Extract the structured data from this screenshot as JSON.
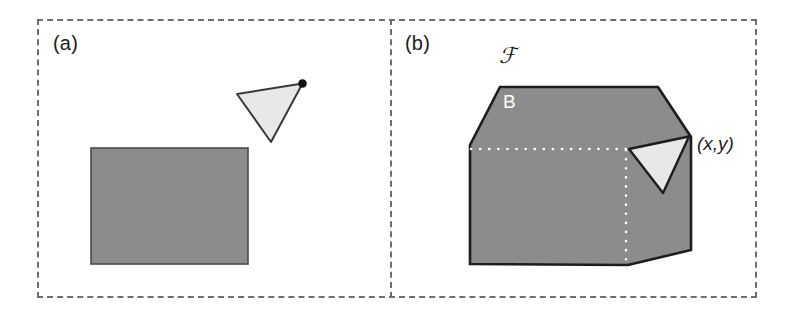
{
  "figure": {
    "type": "diagram",
    "background_color": "#ffffff",
    "frame": {
      "style": "dashed",
      "color": "#6e6e6e",
      "stroke_width": 2.2
    },
    "colors": {
      "grey_fill": "#8c8c8c",
      "light_fill": "#e8e8e8",
      "outline": "#1d1d1d",
      "dotted_white": "#ffffff",
      "label_dark": "#1d1d1d",
      "label_light": "#ffffff"
    }
  },
  "panels": [
    {
      "id": "a",
      "label": "(a)",
      "shapes": [
        {
          "name": "grey-rectangle",
          "kind": "rect",
          "x": 91,
          "y": 148,
          "width": 157,
          "height": 116,
          "fill": "#8c8c8c",
          "stroke": "#4a4a4a"
        },
        {
          "name": "light-triangle",
          "kind": "polygon",
          "points": "302.5,83.5 237,94 271,142",
          "fill": "#e8e8e8",
          "stroke": "#3a3a3a"
        },
        {
          "name": "vertex-dot",
          "kind": "circle",
          "cx": 302.5,
          "cy": 83.5,
          "r": 4.2,
          "fill": "#111111"
        }
      ]
    },
    {
      "id": "b",
      "label": "(b)",
      "labels": {
        "script_f": "ℱ",
        "region_b": "B",
        "coordinate": "(x,y)"
      },
      "shapes": [
        {
          "name": "grey-hexagon-region",
          "kind": "polygon",
          "points": "470,145 500,87 658,87 691,137 691,250 628,265 470,264",
          "fill": "#8c8c8c",
          "stroke": "#1d1d1d"
        },
        {
          "name": "white-triangle-notch",
          "kind": "polygon",
          "points": "689,136.5 629,149 663,193",
          "fill": "#e8e8e8",
          "stroke": "#1d1d1d"
        },
        {
          "name": "horizontal-dotted-line",
          "kind": "line",
          "x1": 471,
          "y1": 149,
          "x2": 628,
          "y2": 149,
          "stroke": "#ffffff"
        },
        {
          "name": "vertical-dotted-line",
          "kind": "line",
          "x1": 626,
          "y1": 149,
          "x2": 626,
          "y2": 264,
          "stroke": "#ffffff"
        }
      ]
    }
  ]
}
